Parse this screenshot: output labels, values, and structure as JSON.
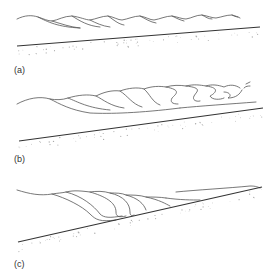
{
  "figure": {
    "panels": [
      {
        "id": "a",
        "label": "(a)",
        "description": "Spilling breakers on a gently sloping beach"
      },
      {
        "id": "b",
        "label": "(b)",
        "description": "Plunging breakers on a moderately sloping beach"
      },
      {
        "id": "c",
        "label": "(c)",
        "description": "Surging breakers on a steep beach"
      }
    ]
  }
}
